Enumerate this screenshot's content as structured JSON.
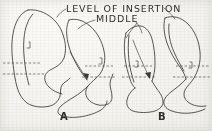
{
  "figure": {
    "kind": "anatomical-line-drawing",
    "background_color": "#f4f3ef",
    "ink_color": "#3b3a38",
    "width": 212,
    "height": 131,
    "title_line1": "LEVEL OF INSERTION",
    "title_line2": "MIDDLE",
    "panels": [
      {
        "label": "A",
        "label_x": 62,
        "label_y": 118,
        "description": "left pair of sagittal tooth/condyle profiles with two dashed insertion-level reference lines"
      },
      {
        "label": "B",
        "label_x": 160,
        "label_y": 118,
        "description": "right pair of narrower sagittal tooth/condyle profiles with two dashed insertion-level reference lines"
      }
    ],
    "reference_lines": [
      {
        "name": "upper-insertion-level-a",
        "y": 63
      },
      {
        "name": "lower-insertion-level-a",
        "y": 74
      },
      {
        "name": "upper-insertion-level-b",
        "y": 66
      },
      {
        "name": "lower-insertion-level-b",
        "y": 77
      }
    ],
    "arrows": [
      {
        "name": "insertion-arrow-a",
        "target_x": 88,
        "target_y": 80
      },
      {
        "name": "insertion-arrow-b",
        "target_x": 150,
        "target_y": 79
      }
    ],
    "leaders": [
      {
        "name": "title-leader-left"
      },
      {
        "name": "title-leader-right"
      },
      {
        "name": "middle-leader"
      }
    ]
  }
}
